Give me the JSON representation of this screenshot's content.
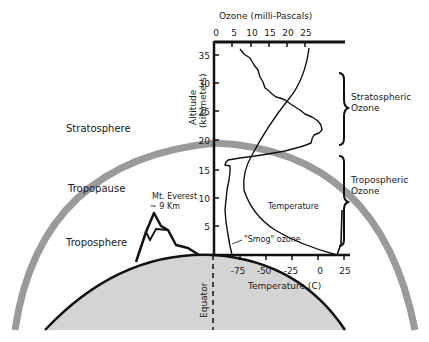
{
  "diagram": {
    "layers": {
      "stratosphere": "Stratosphere",
      "tropopause": "Tropopause",
      "troposphere": "Troposphere"
    },
    "everest": {
      "line1": "Mt. Everest",
      "line2": "~ 9 Km"
    },
    "equator": "Equator",
    "ozone_axis": {
      "title": "Ozone (milli-Pascals)",
      "ticks": [
        "0",
        "5",
        "10",
        "15",
        "20",
        "25"
      ]
    },
    "altitude_axis": {
      "title_line1": "Altitude",
      "title_line2": "(kilometers)",
      "ticks": [
        "5",
        "10",
        "15",
        "20",
        "25",
        "30",
        "35"
      ]
    },
    "temperature_axis": {
      "title": "Temperature (C)",
      "ticks": [
        "-75",
        "-50",
        "-25",
        "0",
        "25"
      ]
    },
    "curve_labels": {
      "temperature": "Temperature",
      "smog": "\"Smog\" ozone"
    },
    "brackets": {
      "stratospheric_line1": "Stratospheric",
      "stratospheric_line2": "Ozone",
      "tropospheric_line1": "Tropospheric",
      "tropospheric_line2": "Ozone"
    },
    "colors": {
      "earth_fill": "#d4d4d4",
      "tropopause_band": "#9a9a9a",
      "line": "#111111"
    }
  }
}
